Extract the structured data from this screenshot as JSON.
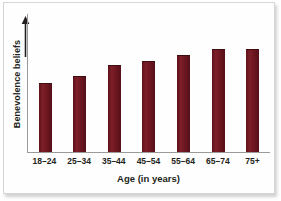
{
  "chart_data": {
    "type": "bar",
    "title": "",
    "xlabel": "Age (in years)",
    "ylabel": "Benevolence beliefs",
    "categories": [
      "18–24",
      "25–34",
      "35–44",
      "45–54",
      "55–64",
      "65–74",
      "75+"
    ],
    "values": [
      50,
      55,
      63,
      66,
      70,
      75,
      75
    ],
    "ylim": [
      0,
      100
    ],
    "grid": false,
    "legend": null,
    "axis_style": {
      "y_axis_arrow": true,
      "y_tick_labels": [],
      "x_tick_labels": [
        "18–24",
        "25–34",
        "35–44",
        "45–54",
        "55–64",
        "65–74",
        "75+"
      ]
    },
    "bar_color": "#6d161f",
    "background_color": "#ffffff",
    "series": [
      {
        "name": "Benevolence beliefs",
        "values": [
          50,
          55,
          63,
          66,
          70,
          75,
          75
        ]
      }
    ]
  },
  "colors": {
    "bar": "#6d161f",
    "axis": "#9a9a9a",
    "text": "#231f20",
    "background": "#ffffff",
    "frame": "#d8d6d4"
  }
}
